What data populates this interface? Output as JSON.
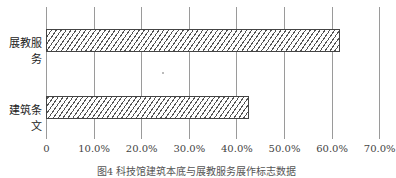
{
  "chart_data": {
    "type": "bar",
    "orientation": "horizontal",
    "title": "",
    "caption": "图4 科技馆建筑本底与展教服务展作标志数据",
    "categories": [
      "展教服务",
      "建筑条文"
    ],
    "values": [
      61.8,
      42.6
    ],
    "unit": "%",
    "xlabel": "",
    "ylabel": "",
    "xlim": [
      0,
      70
    ],
    "x_ticks": [
      "0",
      "10.0%",
      "20.0%",
      "30.0%",
      "40.0%",
      "50.0%",
      "60.0%",
      "70.0%"
    ],
    "grid": "vertical",
    "legend": "none",
    "bar_fill": "diagonal-hatch"
  }
}
